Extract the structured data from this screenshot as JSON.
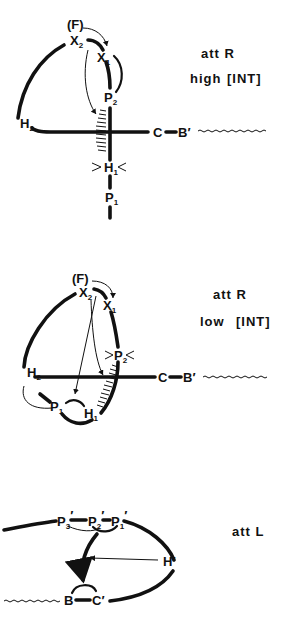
{
  "panels": [
    {
      "id": "attR-high",
      "caption": {
        "line1": "att R",
        "line2_prefix": "high",
        "line2_bracket": "[INT]"
      },
      "nodes": {
        "F": "(F)",
        "X2": "X",
        "X2_sub": "2",
        "X1": "X",
        "X1_sub": "1",
        "P2": "P",
        "P2_sub": "2",
        "H2": "H",
        "H2_sub": "2",
        "H1": "H",
        "H1_sub": "1",
        "P1": "P",
        "P1_sub": "1",
        "C": "C",
        "B_prime": "B′"
      }
    },
    {
      "id": "attR-low",
      "caption": {
        "line1": "att R",
        "line2_prefix": "low",
        "line2_bracket": "[INT]"
      },
      "nodes": {
        "F": "(F)",
        "X2": "X",
        "X2_sub": "2",
        "X1": "X",
        "X1_sub": "1",
        "P2": "P",
        "P2_sub": "2",
        "H2": "H",
        "H2_sub": "2",
        "P1": "P",
        "P1_sub": "1",
        "H1": "H",
        "H1_sub": "1",
        "C": "C",
        "B_prime": "B′"
      }
    },
    {
      "id": "attL",
      "caption": {
        "line1": "att L"
      },
      "nodes": {
        "P3p": "P",
        "P3p_sub": "3",
        "P3p_mark": "′",
        "P2p": "P",
        "P2p_sub": "2",
        "P2p_mark": "′",
        "P1p": "P",
        "P1p_sub": "1",
        "P1p_mark": "′",
        "H_prime": "H′",
        "B": "B",
        "C_prime": "C′"
      }
    }
  ]
}
